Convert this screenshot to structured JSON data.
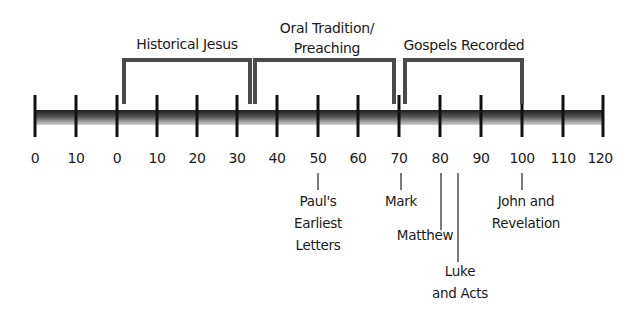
{
  "timeline": {
    "axis": {
      "start_x": 35,
      "end_x": 603,
      "spacing": 40.57,
      "tick_labels": [
        "0",
        "10",
        "0",
        "10",
        "20",
        "30",
        "40",
        "50",
        "60",
        "70",
        "80",
        "90",
        "100",
        "110",
        "120"
      ]
    },
    "brackets": [
      {
        "label": "Historical Jesus",
        "lines": [
          "Historical Jesus"
        ],
        "x1": 124,
        "x2": 250
      },
      {
        "label": "Oral Tradition/ Preaching",
        "lines": [
          "Oral Tradition/",
          "Preaching"
        ],
        "x1": 255,
        "x2": 394
      },
      {
        "label": "Gospels Recorded",
        "lines": [
          "Gospels Recorded"
        ],
        "x1": 405,
        "x2": 522
      }
    ],
    "events": [
      {
        "lines": [
          "Paul's",
          "Earliest",
          "Letters"
        ],
        "year_index": 7
      },
      {
        "lines": [
          "Mark"
        ],
        "year_index": 9
      },
      {
        "lines": [
          "Matthew"
        ],
        "year_index": 10
      },
      {
        "lines": [
          "Luke",
          "and Acts"
        ],
        "year_index": 10.6
      },
      {
        "lines": [
          "John and",
          "Revelation"
        ],
        "year_index": 12
      }
    ]
  },
  "colors": {
    "bracket": "#4a4a4a",
    "tick": "#111111",
    "bar_dark": "#1e1e1e",
    "bar_light": "#c8c8c8",
    "text": "#1a1a1a"
  }
}
